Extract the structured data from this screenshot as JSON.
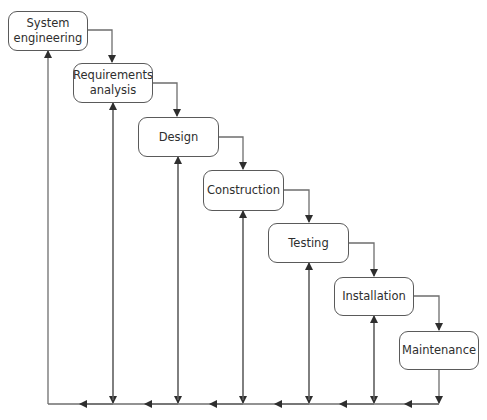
{
  "diagram": {
    "type": "waterfall-model",
    "colors": {
      "line": "#6e6e6e",
      "box_border": "#5a5a5a",
      "text": "#2e2e2e",
      "background": "#ffffff"
    },
    "stages": [
      {
        "id": "system-engineering",
        "label": "System\nengineering"
      },
      {
        "id": "requirements-analysis",
        "label": "Requirements\nanalysis"
      },
      {
        "id": "design",
        "label": "Design"
      },
      {
        "id": "construction",
        "label": "Construction"
      },
      {
        "id": "testing",
        "label": "Testing"
      },
      {
        "id": "installation",
        "label": "Installation"
      },
      {
        "id": "maintenance",
        "label": "Maintenance"
      }
    ],
    "flows": {
      "forward": [
        [
          "system-engineering",
          "requirements-analysis"
        ],
        [
          "requirements-analysis",
          "design"
        ],
        [
          "design",
          "construction"
        ],
        [
          "construction",
          "testing"
        ],
        [
          "testing",
          "installation"
        ],
        [
          "installation",
          "maintenance"
        ]
      ],
      "feedback": "Each stage feeds back via a common bottom line to every earlier stage"
    }
  }
}
